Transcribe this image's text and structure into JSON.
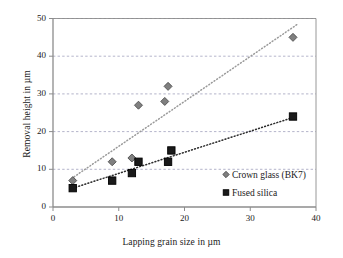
{
  "chart_data": {
    "type": "scatter",
    "title": "",
    "xlabel": "Lapping grain size in µm",
    "ylabel": "Removal height in µm",
    "xlim": [
      0,
      40
    ],
    "ylim": [
      0,
      50
    ],
    "xticks": [
      "0",
      "10",
      "20",
      "30",
      "40"
    ],
    "yticks": [
      "0",
      "10",
      "20",
      "30",
      "40",
      "50"
    ],
    "xtick_values": [
      0,
      10,
      20,
      30,
      40
    ],
    "ytick_values": [
      0,
      10,
      20,
      30,
      40,
      50
    ],
    "grid": "horizontal-dashed",
    "legend_position": "lower-right-inside",
    "series": [
      {
        "name": "Crown glass (BK7)",
        "marker": "diamond",
        "color": "#808080",
        "edge_color": "#4d4d4d",
        "trendline": "dotted",
        "trendline_color": "#9a9a9a",
        "trend_from": [
          3.2,
          8.0
        ],
        "trend_to": [
          37.2,
          48.5
        ],
        "points": [
          {
            "x": 3.0,
            "y": 7
          },
          {
            "x": 9.0,
            "y": 12
          },
          {
            "x": 12.0,
            "y": 13
          },
          {
            "x": 13.0,
            "y": 27
          },
          {
            "x": 17.0,
            "y": 28
          },
          {
            "x": 17.5,
            "y": 32
          },
          {
            "x": 36.5,
            "y": 45
          }
        ]
      },
      {
        "name": "Fused silica",
        "marker": "square",
        "color": "#1a1a1a",
        "edge_color": "#000000",
        "trendline": "dotted",
        "trendline_color": "#2b2b2b",
        "trend_from": [
          3.0,
          5.0
        ],
        "trend_to": [
          36.6,
          23.8
        ],
        "points": [
          {
            "x": 3.0,
            "y": 5
          },
          {
            "x": 9.0,
            "y": 7
          },
          {
            "x": 12.0,
            "y": 9
          },
          {
            "x": 13.0,
            "y": 12
          },
          {
            "x": 17.5,
            "y": 12
          },
          {
            "x": 18.0,
            "y": 15
          },
          {
            "x": 36.5,
            "y": 24
          }
        ]
      }
    ]
  },
  "legend": {
    "entries": [
      {
        "label": "Crown glass (BK7)",
        "marker": "diamond"
      },
      {
        "label": "Fused silica",
        "marker": "square"
      }
    ]
  },
  "colors": {
    "axis": "#8c8c8c",
    "grid": "#6f6f99",
    "text": "#1a1a1a",
    "crown_glass": "#808080",
    "fused_silica": "#1a1a1a",
    "background": "#ffffff"
  }
}
